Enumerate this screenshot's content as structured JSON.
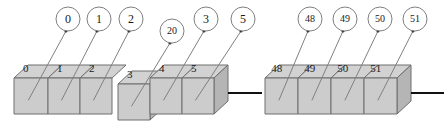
{
  "diagram": {
    "colors": {
      "cube_top": "#d2d2d2",
      "cube_front": "#cccccc",
      "cube_side": "#b5b5b5",
      "edge": "#6e6e6e",
      "leader": "#808080",
      "connector": "#111111",
      "text": "#1a1a1a",
      "background": "#ffffff"
    },
    "groups": [
      {
        "name": "left-group",
        "cells": [
          {
            "cell_label": "0",
            "callout": "0",
            "callout_cx": 68,
            "callout_cy": 19,
            "callout_r": 12,
            "callout_font": 12,
            "front_x": 14,
            "front_w": 34,
            "offset": false
          },
          {
            "cell_label": "1",
            "callout": "1",
            "callout_cx": 99,
            "callout_cy": 19,
            "callout_r": 12,
            "callout_font": 12,
            "front_x": 48,
            "front_w": 32,
            "offset": false
          },
          {
            "cell_label": "2",
            "callout": "2",
            "callout_cx": 131,
            "callout_cy": 19,
            "callout_r": 12,
            "callout_font": 12,
            "front_x": 80,
            "front_w": 32,
            "offset": false
          },
          {
            "cell_label": "3",
            "callout": "20",
            "callout_cx": 172,
            "callout_cy": 31,
            "callout_r": 12,
            "callout_font": 10,
            "front_x": 118,
            "front_w": 32,
            "offset": true
          },
          {
            "cell_label": "4",
            "callout": "3",
            "callout_cx": 206,
            "callout_cy": 19,
            "callout_r": 12,
            "callout_font": 12,
            "front_x": 150,
            "front_w": 32,
            "offset": false
          },
          {
            "cell_label": "5",
            "callout": "5",
            "callout_cx": 243,
            "callout_cy": 19,
            "callout_r": 12,
            "callout_font": 12,
            "front_x": 182,
            "front_w": 32,
            "offset": false
          }
        ]
      },
      {
        "name": "right-group",
        "cells": [
          {
            "cell_label": "48",
            "callout": "48",
            "callout_cx": 310,
            "callout_cy": 19,
            "callout_r": 12,
            "callout_font": 10,
            "front_x": 265,
            "front_w": 33,
            "offset": false
          },
          {
            "cell_label": "49",
            "callout": "49",
            "callout_cx": 345,
            "callout_cy": 19,
            "callout_r": 12,
            "callout_font": 10,
            "front_x": 298,
            "front_w": 33,
            "offset": false
          },
          {
            "cell_label": "50",
            "callout": "50",
            "callout_cx": 380,
            "callout_cy": 19,
            "callout_r": 12,
            "callout_font": 10,
            "front_x": 331,
            "front_w": 33,
            "offset": false
          },
          {
            "cell_label": "51",
            "callout": "51",
            "callout_cx": 415,
            "callout_cy": 19,
            "callout_r": 12,
            "callout_font": 10,
            "front_x": 364,
            "front_w": 33,
            "offset": false
          }
        ]
      }
    ],
    "connectors": [
      {
        "name": "connector-middle",
        "x1": 228,
        "y1": 93,
        "x2": 262,
        "y2": 93
      },
      {
        "name": "connector-right",
        "x1": 411,
        "y1": 93,
        "x2": 444,
        "y2": 93
      }
    ]
  }
}
